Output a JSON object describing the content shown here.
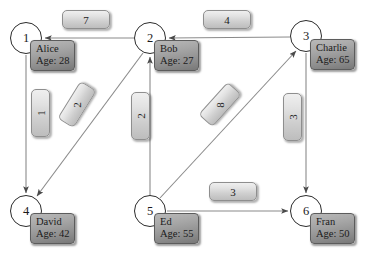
{
  "diagram": {
    "nodes": [
      {
        "id": "1",
        "name": "Alice",
        "age_label": "Age: 28",
        "cx": 26,
        "cy": 38
      },
      {
        "id": "2",
        "name": "Bob",
        "age_label": "Age: 27",
        "cx": 150,
        "cy": 38
      },
      {
        "id": "3",
        "name": "Charlie",
        "age_label": "Age: 65",
        "cx": 306,
        "cy": 36
      },
      {
        "id": "4",
        "name": "David",
        "age_label": "Age: 42",
        "cx": 26,
        "cy": 211
      },
      {
        "id": "5",
        "name": "Ed",
        "age_label": "Age: 55",
        "cx": 150,
        "cy": 211
      },
      {
        "id": "6",
        "name": "Fran",
        "age_label": "Age: 50",
        "cx": 306,
        "cy": 211
      }
    ],
    "edges": [
      {
        "from": "2",
        "to": "1",
        "weight": "7",
        "orient": "h",
        "lx": 62,
        "ly": 10
      },
      {
        "from": "3",
        "to": "2",
        "weight": "4",
        "orient": "h",
        "lx": 203,
        "ly": 10
      },
      {
        "from": "1",
        "to": "4",
        "weight": "1",
        "orient": "v",
        "lx": 31,
        "ly": 89
      },
      {
        "from": "2",
        "to": "4",
        "weight": "2",
        "orient": "d",
        "lx": 62,
        "ly": 93,
        "rot": -58
      },
      {
        "from": "5",
        "to": "2",
        "weight": "2",
        "orient": "v",
        "lx": 131,
        "ly": 92
      },
      {
        "from": "5",
        "to": "3",
        "weight": "8",
        "orient": "d",
        "lx": 204,
        "ly": 93,
        "rot": -49
      },
      {
        "from": "3",
        "to": "6",
        "weight": "3",
        "orient": "v",
        "lx": 283,
        "ly": 93
      },
      {
        "from": "5",
        "to": "6",
        "weight": "3",
        "orient": "h",
        "lx": 209,
        "ly": 182
      }
    ],
    "colors": {
      "node_stroke": "#2b2b2b",
      "node_fill": "#ffffff",
      "edge_stroke": "#8a8a8a",
      "label_box_fill": "#d8d8d8",
      "name_box_fill": "#9a9a9a",
      "text": "#1b1b1b"
    }
  }
}
